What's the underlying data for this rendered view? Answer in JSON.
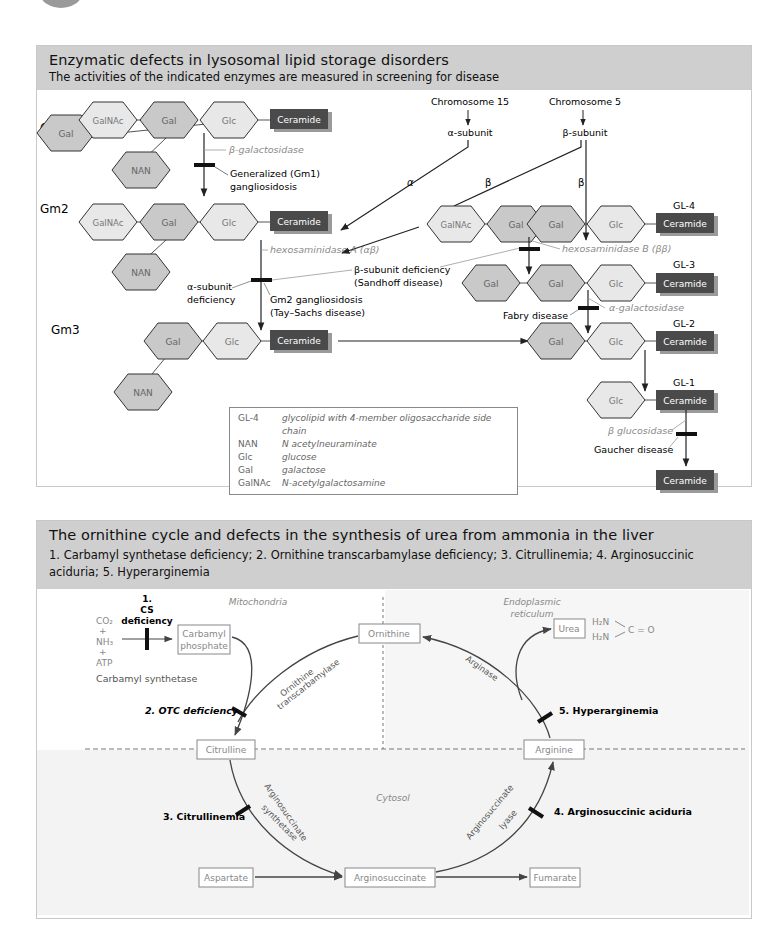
{
  "panel1": {
    "title": "Enzymatic defects in lysosomal lipid storage disorders",
    "subtitle": "The activities of the indicated enzymes are measured in screening for disease",
    "row_labels": {
      "gm1": "Gm1",
      "gm2": "Gm2",
      "gm3": "Gm3"
    },
    "gl_labels": {
      "gl4": "GL-4",
      "gl3": "GL-3",
      "gl2": "GL-2",
      "gl1": "GL-1"
    },
    "sugars": {
      "gal": "Gal",
      "galnac": "GalNAc",
      "glc": "Glc",
      "nan": "NAN",
      "ceramide": "Ceramide"
    },
    "chromosomes": {
      "chr15": "Chromosome 15",
      "chr5": "Chromosome 5",
      "alpha_subunit": "α-subunit",
      "beta_subunit": "β-subunit",
      "alpha": "α",
      "beta": "β"
    },
    "enzymes": {
      "beta_galactosidase": "β-galactosidase",
      "hexA": "hexosaminidase A (αβ)",
      "hexB": "hexosaminidase B (ββ)",
      "alpha_galactosidase": "α-galactosidase",
      "beta_glucosidase": "β glucosidase"
    },
    "diseases": {
      "gm1_line1": "Generalized (Gm1)",
      "gm1_line2": "gangliosidosis",
      "alpha_def_line1": "α-subunit",
      "alpha_def_line2": "deficiency",
      "beta_def_line1": "β-subunit deficiency",
      "beta_def_line2": "(Sandhoff disease)",
      "gm2_line1": "Gm2 gangliosidosis",
      "gm2_line2": "(Tay–Sachs disease)",
      "fabry": "Fabry disease",
      "gaucher": "Gaucher disease"
    },
    "legend": [
      {
        "key": "GL-4",
        "value": "glycolipid with 4-member oligosaccharide side chain"
      },
      {
        "key": "NAN",
        "value": "N acetylneuraminate"
      },
      {
        "key": "Glc",
        "value": "glucose"
      },
      {
        "key": "Gal",
        "value": "galactose"
      },
      {
        "key": "GalNAc",
        "value": "N-acetylgalactosamine"
      }
    ]
  },
  "panel2": {
    "title": "The ornithine cycle and defects in the synthesis of urea from ammonia in the liver",
    "subtitle": "1. Carbamyl synthetase deficiency; 2. Ornithine transcarbamylase deficiency; 3. Citrullinemia; 4. Arginosuccinic aciduria; 5. Hyperarginemia",
    "compartments": {
      "mito": "Mitochondria",
      "er_line1": "Endoplasmic",
      "er_line2": "reticulum",
      "cytosol": "Cytosol"
    },
    "reactants": {
      "co2": "CO₂",
      "plus1": "+",
      "nh3": "NH₃",
      "plus2": "+",
      "atp": "ATP",
      "enzyme": "Carbamyl synthetase"
    },
    "boxes": {
      "carbamyl_line1": "Carbamyl",
      "carbamyl_line2": "phosphate",
      "ornithine": "Ornithine",
      "urea": "Urea",
      "citrulline": "Citrulline",
      "arginine": "Arginine",
      "aspartate": "Aspartate",
      "arginosuccinate": "Arginosuccinate",
      "fumarate": "Fumarate"
    },
    "urea_formula": {
      "h2n_top": "H₂N",
      "h2n_bottom": "H₂N",
      "co": "C = O"
    },
    "enzymes": {
      "otc_line1": "Ornithine",
      "otc_line2": "transcarbamylase",
      "arginase": "Arginase",
      "ass_line1": "Arginosuccinate",
      "ass_line2": "synthetase",
      "asl_line1": "Arginosuccinate",
      "asl_line2": "lyase"
    },
    "defects": {
      "cs_line1": "1.",
      "cs_line2": "CS",
      "cs_line3": "deficiency",
      "otc": "2. OTC deficiency",
      "citrullinemia": "3. Citrullinemia",
      "asa": "4. Arginosuccinic aciduria",
      "hyperarginemia": "5. Hyperarginemia"
    }
  },
  "colors": {
    "header_bg": "#cfcfcf",
    "ceramide": "#4a4a4a",
    "hex_dark": "#c9c9c9",
    "hex_light": "#e6e6e6",
    "enzyme_text": "#8a8a8a"
  }
}
